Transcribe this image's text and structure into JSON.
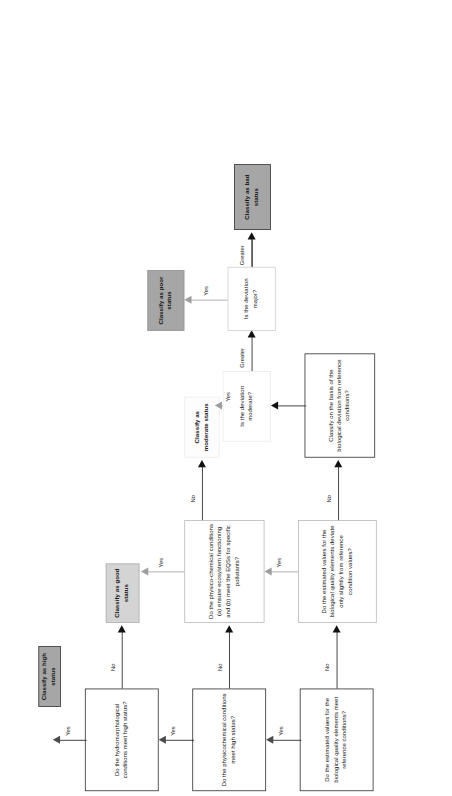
{
  "figure": {
    "type": "flowchart",
    "orientation": "rotated-90-ccw",
    "background": "#ffffff"
  },
  "colors": {
    "high_status_fill": "#a6a6a6",
    "good_status_fill": "#d4d4d4",
    "moderate_status_fill": "#fdfdfd",
    "poor_status_fill": "#a6a6a6",
    "bad_status_fill": "#a6a6a6",
    "box_outline": "#2f2f2f",
    "connector": "#1a1a1a",
    "connector_light": "#9e9e9e"
  },
  "nodes": {
    "biological_reference": "Do the estimated values for the biological quality elements meet reference conditions?",
    "physicochemical_high": "Do the physicochemical conditions meet high status?",
    "hydromorphological_high": "Do the hydromorphological conditions meet high status?",
    "biological_slight_deviation": "Do the estimated values for the biological quality elements deviate only slightly from reference condition values?",
    "physico_chemical_eqs": "Do the physico-chemical conditions (a) ensure ecosystem functioning and (b) meet the EQSs for specific pollutants?",
    "classify_on_basis": "Classify on the basis of the biological deviation from reference conditions?",
    "deviation_moderate": "Is the deviation moderate?",
    "deviation_major": "Is the deviation major?",
    "classify_high": "Classify as high status",
    "classify_good": "Classify as good status",
    "classify_moderate": "Classify as moderate status",
    "classify_poor": "Classify as poor status",
    "classify_bad": "Classify as bad status"
  },
  "edge_labels": {
    "bio_ref_yes": "Yes",
    "bio_ref_no": "No",
    "physchem_yes": "Yes",
    "physchem_no": "No",
    "hydromorph_yes": "Yes",
    "hydromorph_no": "No",
    "bio_slight_yes": "Yes",
    "bio_slight_no": "No",
    "physchem_eqs_yes": "Yes",
    "physchem_eqs_no": "No",
    "moderate_yes": "Yes",
    "moderate_greater": "Greater",
    "major_yes": "Yes",
    "major_greater": "Greater"
  }
}
